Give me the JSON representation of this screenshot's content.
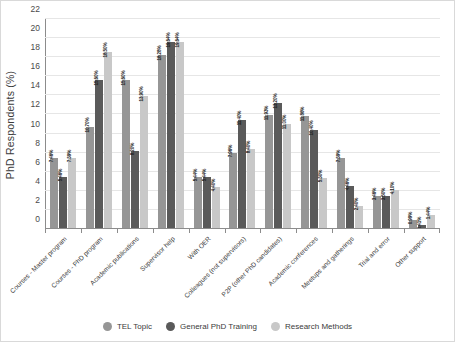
{
  "chart_data": {
    "type": "bar",
    "title": "",
    "xlabel": "",
    "ylabel": "PhD Respondents (%)",
    "ylim": [
      0,
      22
    ],
    "ytick_step": 2,
    "yticks": [
      "0",
      "2",
      "4",
      "6",
      "8",
      "10",
      "12",
      "14",
      "16",
      "18",
      "20",
      "22"
    ],
    "grid": "horizontal",
    "legend_position": "bottom-center",
    "label_format": "percent",
    "categories": [
      "Courses - Master program",
      "Courses - PhD program",
      "Academic publications",
      "Supervisor help",
      "With OER",
      "Colleagues (not supervisors)",
      "P2P (other PhD candidates)",
      "Academic conferences",
      "Meetups and gatherings",
      "Trial and error",
      "Other support"
    ],
    "series": [
      {
        "name": "TEL Topic",
        "color": "#969696",
        "values": [
          7.46,
          10.7,
          15.6,
          18.28,
          5.44,
          7.96,
          11.93,
          11.86,
          7.39,
          3.46,
          0.99
        ],
        "labels": [
          "7.46%",
          "10.70%",
          "15.60%",
          "18.28%",
          "5.44%",
          "7.96%",
          "11.93%",
          "11.86%",
          "7.39%",
          "3.46%",
          "0.99%"
        ]
      },
      {
        "name": "General PhD Training",
        "color": "#5a5a5a",
        "values": [
          5.46,
          15.6,
          8.2,
          19.64,
          5.44,
          11.4,
          13.2,
          10.4,
          4.46,
          3.5,
          0.41
        ],
        "labels": [
          "5.46%",
          "15.60%",
          "8.20%",
          "19.64%",
          "5.44%",
          "11.40%",
          "13.20%",
          "10.40%",
          "4.46%",
          "3.50%",
          "0.41%"
        ]
      },
      {
        "name": "Research Methods",
        "color": "#c8c8c8",
        "values": [
          7.39,
          18.5,
          13.9,
          19.64,
          4.4,
          8.4,
          11.0,
          5.3,
          2.4,
          4.1,
          1.44
        ],
        "labels": [
          "7.39%",
          "18.50%",
          "13.90%",
          "19.64%",
          "4.40%",
          "8.40%",
          "11.00%",
          "5.30%",
          "2.40%",
          "4.10%",
          "1.44%"
        ]
      }
    ]
  }
}
